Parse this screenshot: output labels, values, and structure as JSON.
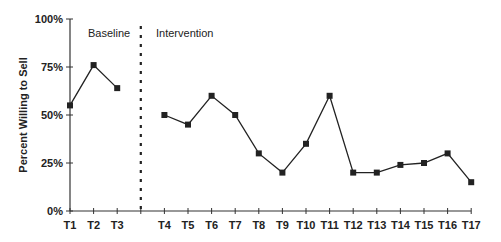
{
  "chart_data": {
    "type": "line",
    "title": "",
    "xlabel": "",
    "ylabel": "Percent Willing to Sell",
    "ylim": [
      0,
      100
    ],
    "yticks": [
      "0%",
      "25%",
      "50%",
      "75%",
      "100%"
    ],
    "grid": false,
    "legend": null,
    "phases": [
      {
        "name": "Baseline",
        "categories": [
          "T1",
          "T2",
          "T3"
        ]
      },
      {
        "name": "Intervention",
        "categories": [
          "T4",
          "T5",
          "T6",
          "T7",
          "T8",
          "T9",
          "T10",
          "T11",
          "T12",
          "T13",
          "T14",
          "T15",
          "T16",
          "T17"
        ]
      }
    ],
    "annotations": [
      "Baseline",
      "Intervention",
      "dashed vertical phase-change line between T3 and T4"
    ],
    "categories": [
      "T1",
      "T2",
      "T3",
      "T4",
      "T5",
      "T6",
      "T7",
      "T8",
      "T9",
      "T10",
      "T11",
      "T12",
      "T13",
      "T14",
      "T15",
      "T16",
      "T17"
    ],
    "series": [
      {
        "name": "Baseline",
        "x": [
          "T1",
          "T2",
          "T3"
        ],
        "values": [
          55,
          76,
          64
        ]
      },
      {
        "name": "Intervention",
        "x": [
          "T4",
          "T5",
          "T6",
          "T7",
          "T8",
          "T9",
          "T10",
          "T11",
          "T12",
          "T13",
          "T14",
          "T15",
          "T16",
          "T17"
        ],
        "values": [
          50,
          45,
          60,
          50,
          30,
          20,
          35,
          60,
          20,
          20,
          24,
          25,
          30,
          15
        ]
      }
    ]
  },
  "labels": {
    "ylabel": "Percent Willing to Sell",
    "baseline": "Baseline",
    "intervention": "Intervention"
  },
  "colors": {
    "line": "#222222",
    "axis": "#333333",
    "text": "#222222"
  }
}
